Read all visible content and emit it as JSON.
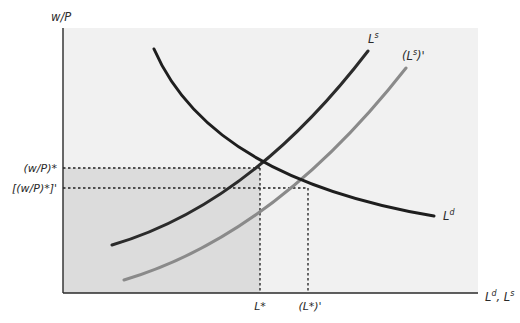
{
  "diagram": {
    "type": "labor-market-supply-demand",
    "axes": {
      "y_label": "w/P",
      "x_label_main": "L",
      "x_label_sup_d": "d",
      "x_label_sep": ", ",
      "x_label_main2": "L",
      "x_label_sup_s": "s"
    },
    "curves": [
      {
        "id": "labor-demand",
        "label_main": "L",
        "label_sup": "d",
        "color": "#1e1e1e"
      },
      {
        "id": "labor-supply",
        "label_main": "L",
        "label_sup": "s",
        "color": "#2b2b2b"
      },
      {
        "id": "labor-supply-shifted",
        "label_open": "(",
        "label_main": "L",
        "label_sup": "s",
        "label_close": ")'",
        "color": "#8a8a8a"
      }
    ],
    "y_ticks": [
      {
        "id": "real-wage-eq",
        "label": "(w/P)*"
      },
      {
        "id": "real-wage-eq-new",
        "label": "[(w/P)*]'"
      }
    ],
    "x_ticks": [
      {
        "id": "employment-eq",
        "label": "L*"
      },
      {
        "id": "employment-eq-new",
        "label": "(L*)'"
      }
    ],
    "colors": {
      "panel_bg": "#f1f1f1",
      "shaded_region": "#dcdcdc",
      "axis": "#2a2a2a",
      "guide_lines": "#1e1e1e"
    }
  }
}
